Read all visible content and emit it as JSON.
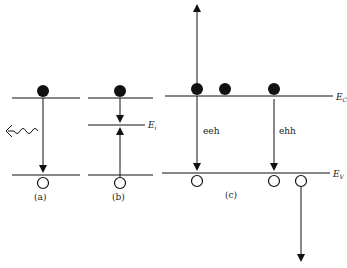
{
  "panels": {
    "a": {
      "label": "(a)"
    },
    "b": {
      "label": "(b)",
      "level_label": "E",
      "level_sub": "i"
    },
    "c": {
      "label": "(c)",
      "conduction_label": "E",
      "conduction_sub": "C",
      "valence_label": "E",
      "valence_sub": "V",
      "transition_1": "eeh",
      "transition_2": "ehh"
    }
  }
}
